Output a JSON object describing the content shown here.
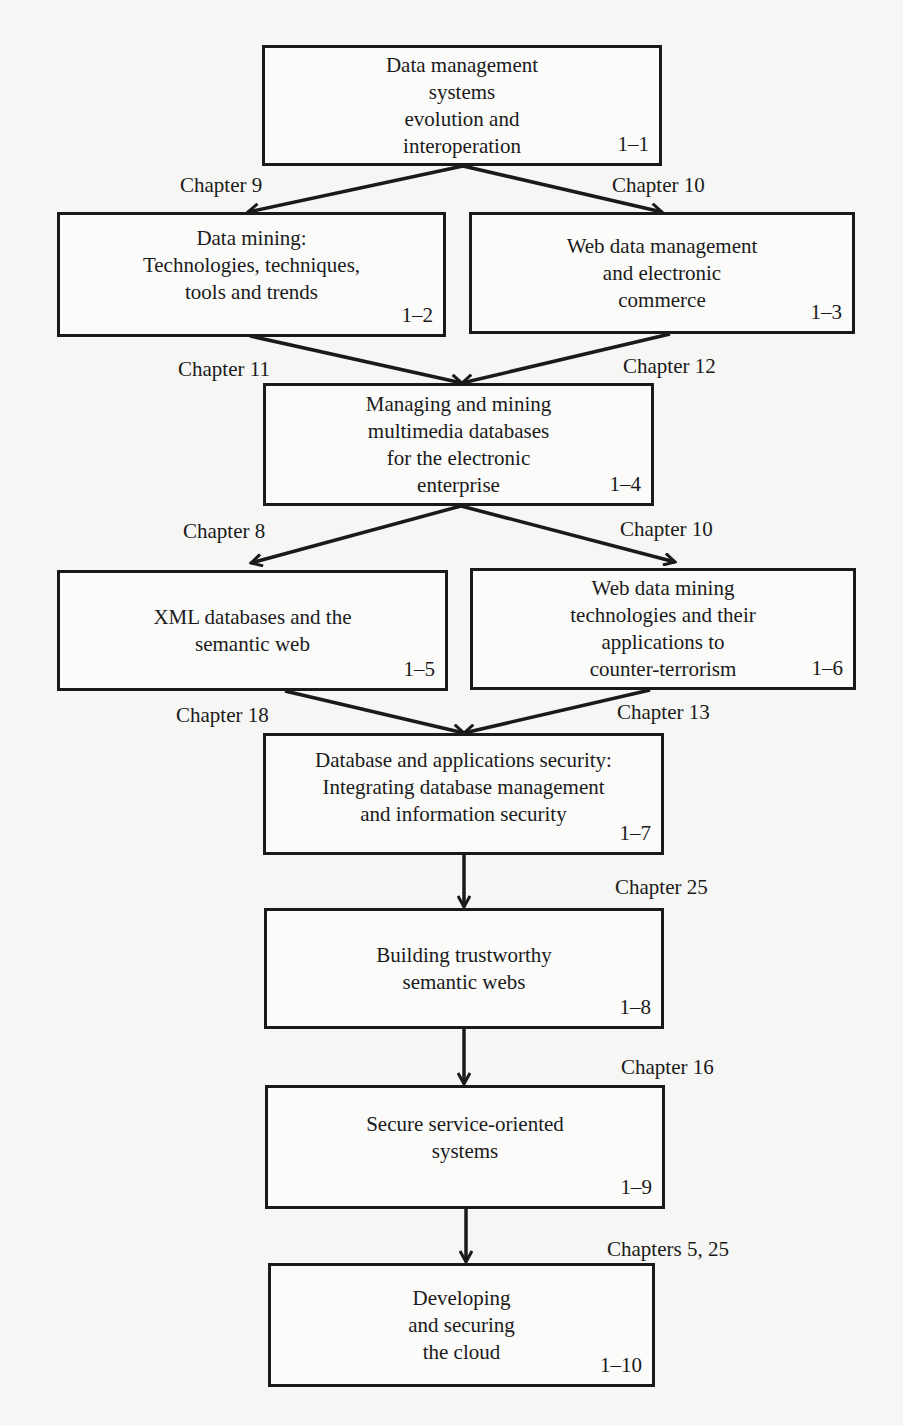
{
  "diagram": {
    "type": "flowchart",
    "boxes": [
      {
        "id": "1-1",
        "text": "Data management\nsystems\nevolution and\ninteroperation",
        "number": "1–1"
      },
      {
        "id": "1-2",
        "text": "Data mining:\nTechnologies, techniques,\ntools and trends",
        "number": "1–2"
      },
      {
        "id": "1-3",
        "text": "Web data management\nand electronic\ncommerce",
        "number": "1–3"
      },
      {
        "id": "1-4",
        "text": "Managing and mining\nmultimedia databases\nfor the electronic\nenterprise",
        "number": "1–4"
      },
      {
        "id": "1-5",
        "text": "XML databases and the\nsemantic web",
        "number": "1–5"
      },
      {
        "id": "1-6",
        "text": "Web data mining\ntechnologies and their\napplications to\ncounter-terrorism",
        "number": "1–6"
      },
      {
        "id": "1-7",
        "text": "Database and applications security:\nIntegrating database management\nand information security",
        "number": "1–7"
      },
      {
        "id": "1-8",
        "text": "Building trustworthy\nsemantic webs",
        "number": "1–8"
      },
      {
        "id": "1-9",
        "text": "Secure service-oriented\nsystems",
        "number": "1–9"
      },
      {
        "id": "1-10",
        "text": "Developing\nand securing\nthe cloud",
        "number": "1–10"
      }
    ],
    "edges": [
      {
        "from": "1-1",
        "to": "1-2",
        "label": "Chapter 9"
      },
      {
        "from": "1-1",
        "to": "1-3",
        "label": "Chapter 10"
      },
      {
        "from": "1-2",
        "to": "1-4",
        "label": "Chapter 11"
      },
      {
        "from": "1-3",
        "to": "1-4",
        "label": "Chapter 12"
      },
      {
        "from": "1-4",
        "to": "1-5",
        "label": "Chapter 8"
      },
      {
        "from": "1-4",
        "to": "1-6",
        "label": "Chapter 10"
      },
      {
        "from": "1-5",
        "to": "1-7",
        "label": "Chapter 18"
      },
      {
        "from": "1-6",
        "to": "1-7",
        "label": "Chapter 13"
      },
      {
        "from": "1-7",
        "to": "1-8",
        "label": "Chapter 25"
      },
      {
        "from": "1-8",
        "to": "1-9",
        "label": "Chapter 16"
      },
      {
        "from": "1-9",
        "to": "1-10",
        "label": "Chapters 5, 25"
      }
    ]
  }
}
